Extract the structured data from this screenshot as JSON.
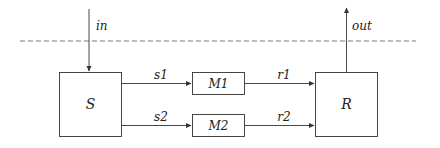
{
  "diagram": {
    "type": "block-diagram",
    "boundary": {
      "style": "dashed",
      "y": 41
    },
    "blocks": [
      {
        "id": "S",
        "label": "S"
      },
      {
        "id": "M1",
        "label": "M1"
      },
      {
        "id": "M2",
        "label": "M2"
      },
      {
        "id": "R",
        "label": "R"
      }
    ],
    "edges": [
      {
        "from": "external",
        "to": "S",
        "label": "in"
      },
      {
        "from": "S",
        "to": "M1",
        "label": "s1"
      },
      {
        "from": "S",
        "to": "M2",
        "label": "s2"
      },
      {
        "from": "M1",
        "to": "R",
        "label": "r1"
      },
      {
        "from": "M2",
        "to": "R",
        "label": "r2"
      },
      {
        "from": "R",
        "to": "external",
        "label": "out"
      }
    ]
  },
  "labels": {
    "S": "S",
    "M1": "M1",
    "M2": "M2",
    "R": "R",
    "in": "in",
    "out": "out",
    "s1": "s1",
    "s2": "s2",
    "r1": "r1",
    "r2": "r2"
  },
  "colors": {
    "stroke": "#333333",
    "dashed": "#666666",
    "text": "#222222"
  }
}
